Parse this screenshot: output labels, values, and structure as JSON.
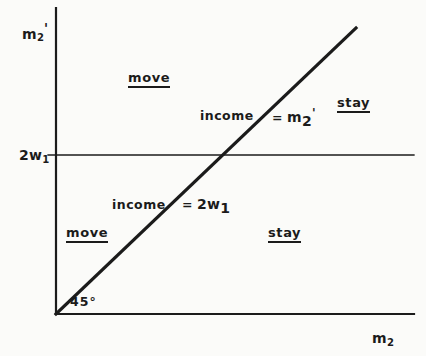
{
  "figure": {
    "type": "economics-phase-diagram",
    "background_color": "#fbfbf9",
    "line_color": "#1b1b1b",
    "axes": {
      "y_axis_label": "m",
      "y_axis_sub": "2",
      "y_axis_prime": "'",
      "x_axis_label": "m",
      "x_axis_sub": "2",
      "origin_px": [
        56,
        314
      ],
      "x_axis_end_px": [
        414,
        314
      ],
      "y_axis_top_px": [
        56,
        8
      ]
    },
    "tick": {
      "label_text": "2w",
      "label_sub": "1",
      "y_px": 155
    },
    "diagonal": {
      "angle_label": "45",
      "degree_symbol": "°",
      "from_px": [
        56,
        314
      ],
      "to_px": [
        356,
        28
      ]
    },
    "horizontal_line": {
      "from_px": [
        56,
        155
      ],
      "to_px": [
        414,
        155
      ]
    },
    "region_labels": [
      {
        "id": "move-upper",
        "text": "move",
        "underlined": true,
        "x": 128,
        "y": 71
      },
      {
        "id": "stay-upper",
        "text": "stay",
        "underlined": true,
        "x": 337,
        "y": 96
      },
      {
        "id": "move-lower",
        "text": "move",
        "underlined": true,
        "x": 66,
        "y": 226
      },
      {
        "id": "stay-lower",
        "text": "stay",
        "underlined": true,
        "x": 268,
        "y": 226
      }
    ],
    "equation_labels": [
      {
        "id": "income-eq-m2prime",
        "lead": "income",
        "equals": "=",
        "var": "m",
        "sub": "2",
        "prime": "'",
        "lead_x": 200,
        "lead_y": 110,
        "rhs_x": 272,
        "rhs_y": 108
      },
      {
        "id": "income-eq-2w1",
        "lead": "income",
        "equals": "=",
        "var": "2w",
        "sub": "1",
        "prime": "",
        "lead_x": 112,
        "lead_y": 199,
        "rhs_x": 182,
        "rhs_y": 199
      }
    ]
  }
}
